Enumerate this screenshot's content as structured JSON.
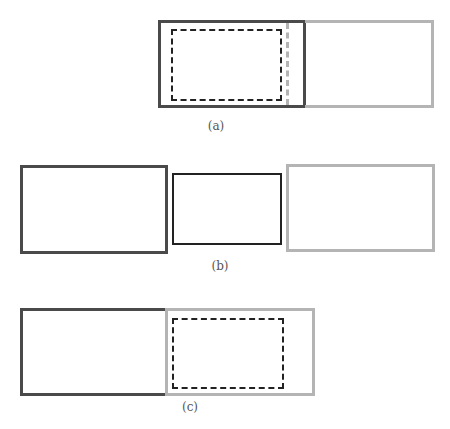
{
  "colors": {
    "dark_box": "#4a4a4a",
    "grey_box": "#b4b4b4",
    "thin_box": "#222222",
    "dashed_box": "#222222",
    "label_text": "#555555"
  },
  "panels": [
    {
      "id": "a",
      "label": "(a)",
      "description": "Dark box adjacent to grey box; dashed rectangle inside dark box; grey dashed vertical line near dark box's right edge"
    },
    {
      "id": "b",
      "label": "(b)",
      "description": "Dark box, thin black box, and grey box separated side by side"
    },
    {
      "id": "c",
      "label": "(c)",
      "description": "Dark box adjacent to grey box; dashed rectangle inside grey box"
    }
  ]
}
